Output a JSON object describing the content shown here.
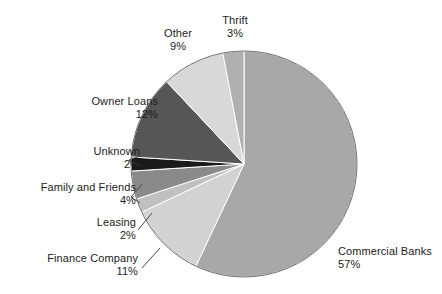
{
  "chart_data": {
    "type": "pie",
    "title": "",
    "subtitle": "",
    "xlabel": "",
    "ylabel": "",
    "legend_position": "none",
    "grid": false,
    "label_format": "name + percent",
    "start_angle_deg": 0,
    "direction": "clockwise",
    "total_percent": 100,
    "categories": [
      "Commercial Banks",
      "Finance Company",
      "Leasing",
      "Family and Friends",
      "Unknown",
      "Owner Loans",
      "Other",
      "Thrift"
    ],
    "values": [
      57,
      11,
      2,
      4,
      2,
      12,
      9,
      3
    ],
    "slices": [
      {
        "label": "Commercial Banks",
        "percent": 57,
        "percent_text": "57%",
        "color": "#a8a8a8"
      },
      {
        "label": "Finance Company",
        "percent": 11,
        "percent_text": "11%",
        "color": "#d2d2d2"
      },
      {
        "label": "Leasing",
        "percent": 2,
        "percent_text": "2%",
        "color": "#c0c0c0"
      },
      {
        "label": "Family and Friends",
        "percent": 4,
        "percent_text": "4%",
        "color": "#8a8a8a"
      },
      {
        "label": "Unknown",
        "percent": 2,
        "percent_text": "2%",
        "color": "#1a1a1a"
      },
      {
        "label": "Owner Loans",
        "percent": 12,
        "percent_text": "12%",
        "color": "#565656"
      },
      {
        "label": "Other",
        "percent": 9,
        "percent_text": "9%",
        "color": "#d8d8d8"
      },
      {
        "label": "Thrift",
        "percent": 3,
        "percent_text": "3%",
        "color": "#b0b0b0"
      }
    ]
  },
  "colors": {
    "background": "#ffffff",
    "text": "#1c1c1c",
    "outline": "#707070",
    "leader_line": "#4a4a4a"
  },
  "geometry": {
    "center_x": 244,
    "center_y": 164,
    "radius": 113
  }
}
